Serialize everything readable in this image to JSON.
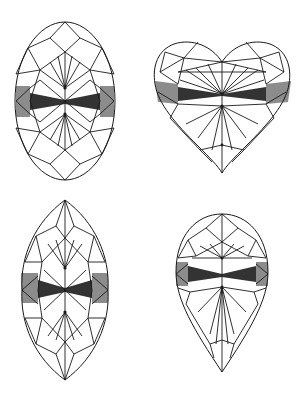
{
  "figure": {
    "colors": {
      "background": "#ffffff",
      "line": "#1a1a1a",
      "bowtie_dark": "#333333",
      "side_shade": "#8c8c8c"
    },
    "shapes": [
      {
        "id": "oval",
        "label": "Oval",
        "position": "top-left"
      },
      {
        "id": "heart",
        "label": "Heart",
        "position": "top-right"
      },
      {
        "id": "marquise",
        "label": "Marquise",
        "position": "bottom-left"
      },
      {
        "id": "pear",
        "label": "Pear",
        "position": "bottom-right"
      }
    ],
    "caption": ""
  }
}
